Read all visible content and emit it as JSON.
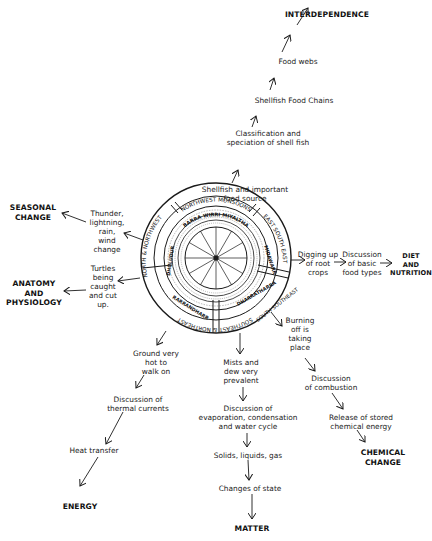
{
  "diagram": {
    "wheel": {
      "outer_ring": [
        "NORTHWEST MONSOONS",
        "EAST SOUTH EAST",
        "SOUTH SOUTHEAST",
        "SOUTHEAST & NORTHEAST",
        "NORTH & NORTHWEST"
      ],
      "second_ring": [
        "BARRA WIRRI MIYALTHA",
        "MIDAWARR",
        "DHARRATHARRA",
        "RARRANDHARR",
        "DHULUDUR"
      ],
      "center_label": "calendar hub"
    },
    "branches": {
      "top": {
        "steps": [
          "Shellfish and important\nfood source",
          "Classification and\nspeciation of shell fish",
          "Shellfish Food Chains",
          "Food webs"
        ],
        "concept": "INTERDEPENDENCE"
      },
      "left_upper": {
        "steps": [
          "Thunder,\nlightning,\nrain,\nwind\nchange"
        ],
        "concept": "SEASONAL\nCHANGE"
      },
      "left_lower": {
        "steps": [
          "Turtles\nbeing\ncaught\nand cut\nup."
        ],
        "concept": "ANATOMY\nAND\nPHYSIOLOGY"
      },
      "right": {
        "steps": [
          "Digging up\nof root\ncrops",
          "Discussion\nof basic\nfood types"
        ],
        "concept": "DIET\nAND\nNUTRITION"
      },
      "bottom_left": {
        "steps": [
          "Ground very\nhot to\nwalk on",
          "Discussion of\nthermal currents",
          "Heat transfer"
        ],
        "concept": "ENERGY"
      },
      "bottom_center": {
        "steps": [
          "Mists and\ndew very\nprevalent",
          "Discussion of\nevaporation, condensation\nand water cycle",
          "Solids, liquids, gas",
          "Changes of state"
        ],
        "concept": "MATTER"
      },
      "bottom_right": {
        "steps": [
          "Burning\noff is\ntaking\nplace",
          "Discussion\nof combustion",
          "Release of stored\nchemical energy"
        ],
        "concept": "CHEMICAL\nCHANGE"
      }
    },
    "colors": {
      "ink": "#1a1a1a",
      "background": "#ffffff"
    }
  }
}
